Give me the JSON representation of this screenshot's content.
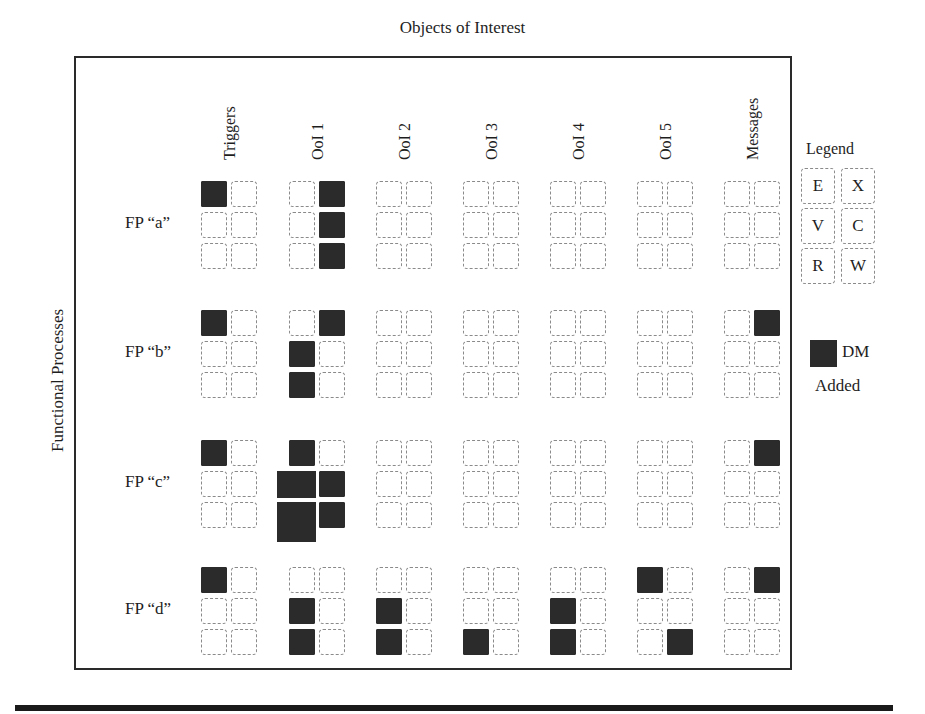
{
  "title": "Objects of Interest",
  "y_axis_label": "Functional Processes",
  "columns": [
    "Triggers",
    "OoI 1",
    "OoI 2",
    "OoI 3",
    "OoI 4",
    "OoI 5",
    "Messages"
  ],
  "rows": [
    {
      "label": "FP “a”",
      "filled": {
        "Triggers": [
          [
            1,
            0
          ],
          [
            0,
            0
          ],
          [
            0,
            0
          ]
        ],
        "OoI 1": [
          [
            0,
            1
          ],
          [
            0,
            1
          ],
          [
            0,
            1
          ]
        ],
        "OoI 2": [
          [
            0,
            0
          ],
          [
            0,
            0
          ],
          [
            0,
            0
          ]
        ],
        "OoI 3": [
          [
            0,
            0
          ],
          [
            0,
            0
          ],
          [
            0,
            0
          ]
        ],
        "OoI 4": [
          [
            0,
            0
          ],
          [
            0,
            0
          ],
          [
            0,
            0
          ]
        ],
        "OoI 5": [
          [
            0,
            0
          ],
          [
            0,
            0
          ],
          [
            0,
            0
          ]
        ],
        "Messages": [
          [
            0,
            0
          ],
          [
            0,
            0
          ],
          [
            0,
            0
          ]
        ]
      }
    },
    {
      "label": "FP “b”",
      "filled": {
        "Triggers": [
          [
            1,
            0
          ],
          [
            0,
            0
          ],
          [
            0,
            0
          ]
        ],
        "OoI 1": [
          [
            0,
            1
          ],
          [
            1,
            0
          ],
          [
            1,
            0
          ]
        ],
        "OoI 2": [
          [
            0,
            0
          ],
          [
            0,
            0
          ],
          [
            0,
            0
          ]
        ],
        "OoI 3": [
          [
            0,
            0
          ],
          [
            0,
            0
          ],
          [
            0,
            0
          ]
        ],
        "OoI 4": [
          [
            0,
            0
          ],
          [
            0,
            0
          ],
          [
            0,
            0
          ]
        ],
        "OoI 5": [
          [
            0,
            0
          ],
          [
            0,
            0
          ],
          [
            0,
            0
          ]
        ],
        "Messages": [
          [
            0,
            1
          ],
          [
            0,
            0
          ],
          [
            0,
            0
          ]
        ]
      }
    },
    {
      "label": "FP “c”",
      "filled": {
        "Triggers": [
          [
            1,
            0
          ],
          [
            0,
            0
          ],
          [
            0,
            0
          ]
        ],
        "OoI 1": [
          [
            1,
            0
          ],
          [
            2,
            1
          ],
          [
            3,
            1
          ]
        ],
        "OoI 2": [
          [
            0,
            0
          ],
          [
            0,
            0
          ],
          [
            0,
            0
          ]
        ],
        "OoI 3": [
          [
            0,
            0
          ],
          [
            0,
            0
          ],
          [
            0,
            0
          ]
        ],
        "OoI 4": [
          [
            0,
            0
          ],
          [
            0,
            0
          ],
          [
            0,
            0
          ]
        ],
        "OoI 5": [
          [
            0,
            0
          ],
          [
            0,
            0
          ],
          [
            0,
            0
          ]
        ],
        "Messages": [
          [
            0,
            1
          ],
          [
            0,
            0
          ],
          [
            0,
            0
          ]
        ]
      }
    },
    {
      "label": "FP “d”",
      "filled": {
        "Triggers": [
          [
            1,
            0
          ],
          [
            0,
            0
          ],
          [
            0,
            0
          ]
        ],
        "OoI 1": [
          [
            0,
            0
          ],
          [
            1,
            0
          ],
          [
            1,
            0
          ]
        ],
        "OoI 2": [
          [
            0,
            0
          ],
          [
            1,
            0
          ],
          [
            1,
            0
          ]
        ],
        "OoI 3": [
          [
            0,
            0
          ],
          [
            0,
            0
          ],
          [
            1,
            0
          ]
        ],
        "OoI 4": [
          [
            0,
            0
          ],
          [
            1,
            0
          ],
          [
            1,
            0
          ]
        ],
        "OoI 5": [
          [
            1,
            0
          ],
          [
            0,
            0
          ],
          [
            0,
            1
          ]
        ],
        "Messages": [
          [
            0,
            1
          ],
          [
            0,
            0
          ],
          [
            0,
            0
          ]
        ]
      }
    }
  ],
  "legend": {
    "title": "Legend",
    "cells": [
      [
        "E",
        "X"
      ],
      [
        "V",
        "C"
      ],
      [
        "R",
        "W"
      ]
    ],
    "dm_label_line1": "DM",
    "dm_label_line2": "Added"
  },
  "colors": {
    "filled": "#2b2b2b",
    "dashed_border": "#8a8a8a",
    "frame": "#2a2a2a"
  }
}
